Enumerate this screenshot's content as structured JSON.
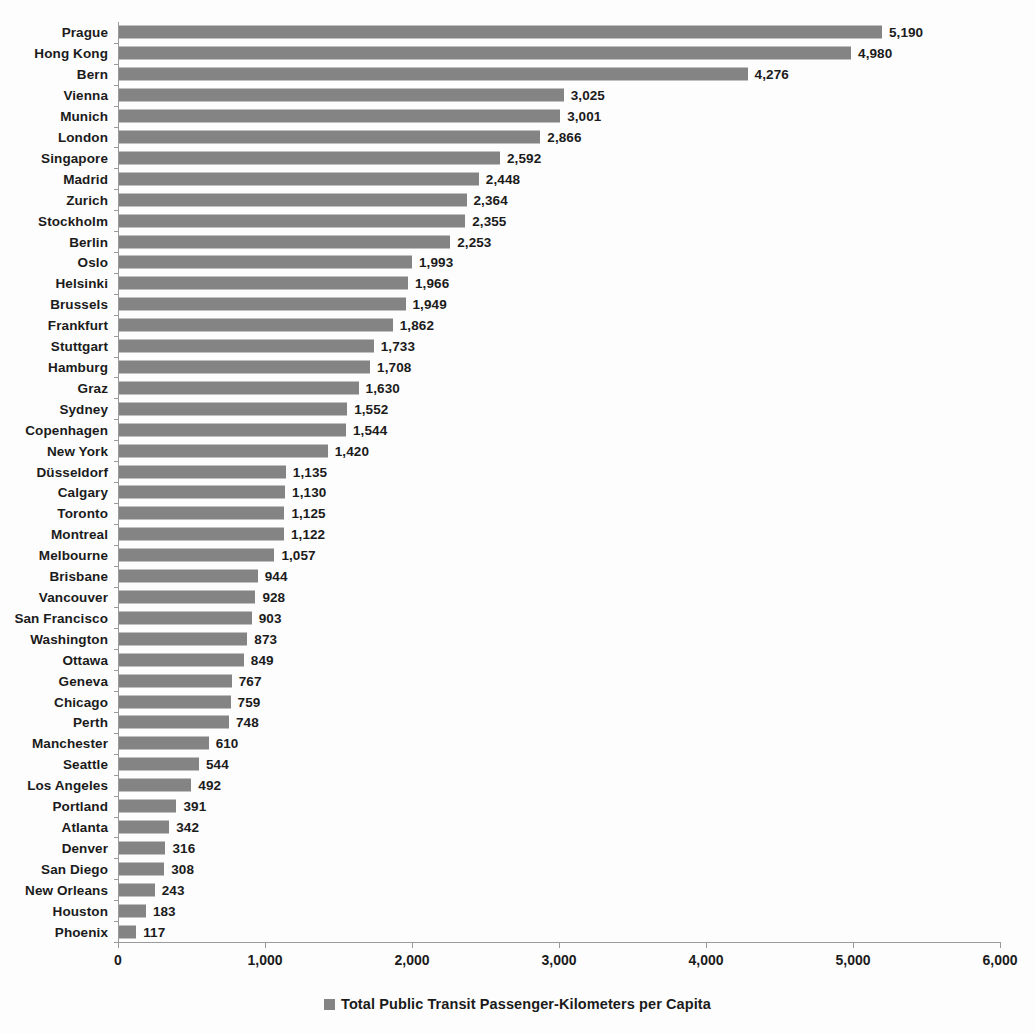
{
  "chart_data": {
    "type": "bar",
    "orientation": "horizontal",
    "title": "",
    "xlabel": "",
    "ylabel": "",
    "xlim": [
      0,
      6000
    ],
    "xticks": [
      "0",
      "1,000",
      "2,000",
      "3,000",
      "4,000",
      "5,000",
      "6,000"
    ],
    "xtick_values": [
      0,
      1000,
      2000,
      3000,
      4000,
      5000,
      6000
    ],
    "grid": false,
    "legend_position": "bottom",
    "legend": [
      "Total Public Transit Passenger-Kilometers per Capita"
    ],
    "series_name": "Total Public Transit Passenger-Kilometers per Capita",
    "bar_color": "#848484",
    "categories": [
      "Prague",
      "Hong Kong",
      "Bern",
      "Vienna",
      "Munich",
      "London",
      "Singapore",
      "Madrid",
      "Zurich",
      "Stockholm",
      "Berlin",
      "Oslo",
      "Helsinki",
      "Brussels",
      "Frankfurt",
      "Stuttgart",
      "Hamburg",
      "Graz",
      "Sydney",
      "Copenhagen",
      "New York",
      "Düsseldorf",
      "Calgary",
      "Toronto",
      "Montreal",
      "Melbourne",
      "Brisbane",
      "Vancouver",
      "San Francisco",
      "Washington",
      "Ottawa",
      "Geneva",
      "Chicago",
      "Perth",
      "Manchester",
      "Seattle",
      "Los Angeles",
      "Portland",
      "Atlanta",
      "Denver",
      "San Diego",
      "New Orleans",
      "Houston",
      "Phoenix"
    ],
    "values": [
      5190,
      4980,
      4276,
      3025,
      3001,
      2866,
      2592,
      2448,
      2364,
      2355,
      2253,
      1993,
      1966,
      1949,
      1862,
      1733,
      1708,
      1630,
      1552,
      1544,
      1420,
      1135,
      1130,
      1125,
      1122,
      1057,
      944,
      928,
      903,
      873,
      849,
      767,
      759,
      748,
      610,
      544,
      492,
      391,
      342,
      316,
      308,
      243,
      183,
      117
    ],
    "value_labels": [
      "5,190",
      "4,980",
      "4,276",
      "3,025",
      "3,001",
      "2,866",
      "2,592",
      "2,448",
      "2,364",
      "2,355",
      "2,253",
      "1,993",
      "1,966",
      "1,949",
      "1,862",
      "1,733",
      "1,708",
      "1,630",
      "1,552",
      "1,544",
      "1,420",
      "1,135",
      "1,130",
      "1,125",
      "1,122",
      "1,057",
      "944",
      "928",
      "903",
      "873",
      "849",
      "767",
      "759",
      "748",
      "610",
      "544",
      "492",
      "391",
      "342",
      "316",
      "308",
      "243",
      "183",
      "117"
    ]
  }
}
